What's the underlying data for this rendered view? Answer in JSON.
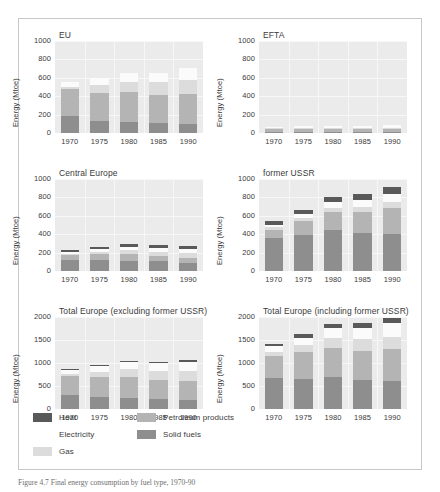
{
  "figure": {
    "caption": "Figure 4.7  Final energy consumption by fuel type, 1970-90",
    "axis_label": "Energy (Mtoe)",
    "background": "#ffffff",
    "plot_background": "#ebebeb",
    "grid_color": "#f7f7f7"
  },
  "legend": {
    "items": [
      {
        "label": "Heat",
        "color": "#595959"
      },
      {
        "label": "Electricity",
        "color": "#fbfbfb"
      },
      {
        "label": "Gas",
        "color": "#dcdcdc"
      },
      {
        "label": "Petroleum products",
        "color": "#b4b4b4"
      },
      {
        "label": "Solid fuels",
        "color": "#8e8e8e"
      }
    ]
  },
  "chart_data": [
    {
      "type": "bar",
      "stacked": true,
      "title": "EU",
      "xlabel": "",
      "ylabel": "Energy (Mtoe)",
      "ylim": [
        0,
        1000
      ],
      "yticks": [
        0,
        200,
        400,
        600,
        800,
        1000
      ],
      "grid": true,
      "legend_position": "figure-bottom",
      "categories": [
        "1970",
        "1975",
        "1980",
        "1985",
        "1990"
      ],
      "series": [
        {
          "name": "Solid fuels",
          "values": [
            185,
            135,
            120,
            110,
            100
          ]
        },
        {
          "name": "Petroleum products",
          "values": [
            290,
            300,
            325,
            300,
            320
          ]
        },
        {
          "name": "Gas",
          "values": [
            30,
            90,
            110,
            140,
            155
          ]
        },
        {
          "name": "Electricity",
          "values": [
            50,
            75,
            95,
            105,
            130
          ]
        },
        {
          "name": "Heat",
          "values": [
            0,
            0,
            0,
            0,
            0
          ]
        }
      ],
      "totals": [
        555,
        600,
        650,
        655,
        705
      ]
    },
    {
      "type": "bar",
      "stacked": true,
      "title": "EFTA",
      "xlabel": "",
      "ylabel": "Energy (Mtoe)",
      "ylim": [
        0,
        1000
      ],
      "yticks": [
        0,
        200,
        400,
        600,
        800,
        1000
      ],
      "grid": true,
      "legend_position": "figure-bottom",
      "categories": [
        "1970",
        "1975",
        "1980",
        "1985",
        "1990"
      ],
      "series": [
        {
          "name": "Solid fuels",
          "values": [
            14,
            12,
            10,
            10,
            10
          ]
        },
        {
          "name": "Petroleum products",
          "values": [
            40,
            42,
            44,
            38,
            38
          ]
        },
        {
          "name": "Gas",
          "values": [
            2,
            3,
            5,
            7,
            9
          ]
        },
        {
          "name": "Electricity",
          "values": [
            14,
            18,
            22,
            26,
            30
          ]
        },
        {
          "name": "Heat",
          "values": [
            0,
            0,
            0,
            0,
            0
          ]
        }
      ],
      "totals": [
        70,
        75,
        81,
        81,
        87
      ]
    },
    {
      "type": "bar",
      "stacked": true,
      "title": "Central Europe",
      "xlabel": "",
      "ylabel": "Energy (Mtoe)",
      "ylim": [
        0,
        1000
      ],
      "yticks": [
        0,
        200,
        400,
        600,
        800,
        1000
      ],
      "grid": true,
      "legend_position": "figure-bottom",
      "categories": [
        "1970",
        "1975",
        "1980",
        "1985",
        "1990"
      ],
      "series": [
        {
          "name": "Solid fuels",
          "values": [
            115,
            115,
            110,
            105,
            90
          ]
        },
        {
          "name": "Petroleum products",
          "values": [
            55,
            65,
            70,
            55,
            55
          ]
        },
        {
          "name": "Gas",
          "values": [
            20,
            30,
            45,
            45,
            50
          ]
        },
        {
          "name": "Electricity",
          "values": [
            20,
            25,
            35,
            40,
            40
          ]
        },
        {
          "name": "Heat",
          "values": [
            22,
            28,
            35,
            35,
            32
          ]
        }
      ],
      "totals": [
        232,
        263,
        295,
        280,
        267
      ]
    },
    {
      "type": "bar",
      "stacked": true,
      "title": "former USSR",
      "xlabel": "",
      "ylabel": "Energy (Mtoe)",
      "ylim": [
        0,
        1000
      ],
      "yticks": [
        0,
        200,
        400,
        600,
        800,
        1000
      ],
      "grid": true,
      "legend_position": "figure-bottom",
      "categories": [
        "1970",
        "1975",
        "1980",
        "1985",
        "1990"
      ],
      "series": [
        {
          "name": "Solid fuels",
          "values": [
            360,
            395,
            450,
            415,
            400
          ]
        },
        {
          "name": "Petroleum products",
          "values": [
            85,
            150,
            190,
            230,
            285
          ]
        },
        {
          "name": "Gas",
          "values": [
            30,
            35,
            45,
            50,
            60
          ]
        },
        {
          "name": "Electricity",
          "values": [
            30,
            35,
            60,
            80,
            95
          ]
        },
        {
          "name": "Heat",
          "values": [
            35,
            50,
            55,
            65,
            70
          ]
        }
      ],
      "totals": [
        540,
        665,
        800,
        840,
        910
      ]
    },
    {
      "type": "bar",
      "stacked": true,
      "title": "Total Europe (excluding former USSR)",
      "xlabel": "",
      "ylabel": "Energy (Mtoe)",
      "ylim": [
        0,
        2000
      ],
      "yticks": [
        0,
        500,
        1000,
        1500,
        2000
      ],
      "grid": true,
      "legend_position": "figure-bottom",
      "categories": [
        "1970",
        "1975",
        "1980",
        "1985",
        "1990"
      ],
      "series": [
        {
          "name": "Solid fuels",
          "values": [
            315,
            260,
            240,
            225,
            200
          ]
        },
        {
          "name": "Petroleum products",
          "values": [
            400,
            425,
            455,
            400,
            415
          ]
        },
        {
          "name": "Gas",
          "values": [
            55,
            125,
            165,
            195,
            215
          ]
        },
        {
          "name": "Electricity",
          "values": [
            85,
            120,
            155,
            175,
            200
          ]
        },
        {
          "name": "Heat",
          "values": [
            22,
            28,
            35,
            35,
            32
          ]
        }
      ],
      "totals": [
        877,
        958,
        1050,
        1030,
        1062
      ]
    },
    {
      "type": "bar",
      "stacked": true,
      "title": "Total Europe (including former USSR)",
      "xlabel": "",
      "ylabel": "Energy (Mtoe)",
      "ylim": [
        0,
        2000
      ],
      "yticks": [
        0,
        500,
        1000,
        1500,
        2000
      ],
      "grid": true,
      "legend_position": "figure-bottom",
      "categories": [
        "1970",
        "1975",
        "1980",
        "1985",
        "1990"
      ],
      "series": [
        {
          "name": "Solid fuels",
          "values": [
            675,
            655,
            690,
            640,
            600
          ]
        },
        {
          "name": "Petroleum products",
          "values": [
            485,
            575,
            645,
            630,
            700
          ]
        },
        {
          "name": "Gas",
          "values": [
            85,
            160,
            210,
            245,
            275
          ]
        },
        {
          "name": "Electricity",
          "values": [
            115,
            155,
            215,
            255,
            295
          ]
        },
        {
          "name": "Heat",
          "values": [
            57,
            78,
            90,
            100,
            102
          ]
        }
      ],
      "totals": [
        1417,
        1623,
        1850,
        1870,
        1972
      ]
    }
  ]
}
